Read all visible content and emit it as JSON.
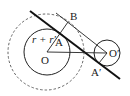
{
  "diagram": {
    "type": "geometry",
    "labels": {
      "B": "B",
      "A": "A",
      "O": "O",
      "O_prime": "O′",
      "A_prime": "A′",
      "radius_sum": "r + r′"
    },
    "colors": {
      "stroke": "#222222",
      "background": "#ffffff"
    }
  }
}
